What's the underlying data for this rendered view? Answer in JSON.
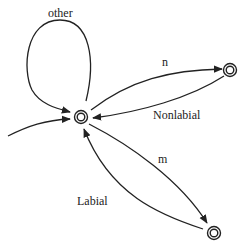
{
  "diagram": {
    "type": "finite-state-automaton",
    "nodes": [
      {
        "id": "start",
        "kind": "accepting",
        "x": 81,
        "y": 117
      },
      {
        "id": "n-state",
        "kind": "accepting",
        "x": 230,
        "y": 70
      },
      {
        "id": "m-state",
        "kind": "accepting",
        "x": 214,
        "y": 233
      }
    ],
    "edges": [
      {
        "from": "start",
        "to": "start",
        "label": "other"
      },
      {
        "from": "start",
        "to": "n-state",
        "label": "n"
      },
      {
        "from": "n-state",
        "to": "start",
        "label": "Nonlabial"
      },
      {
        "from": "start",
        "to": "m-state",
        "label": "m"
      },
      {
        "from": "m-state",
        "to": "start",
        "label": "Labial"
      },
      {
        "from": "entry",
        "to": "start",
        "label": ""
      }
    ],
    "labels": {
      "other": "other",
      "n": "n",
      "nonlabial": "Nonlabial",
      "m": "m",
      "labial": "Labial"
    }
  }
}
